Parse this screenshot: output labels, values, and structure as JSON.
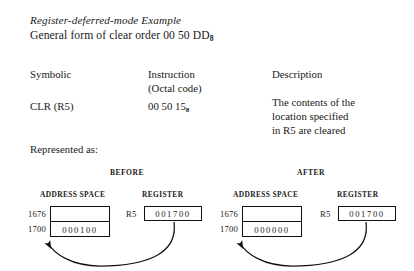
{
  "heading": {
    "title": "Register-deferred-mode Example",
    "subtitle_prefix": "General form of clear order 00  50  DD",
    "subtitle_subscript": "8"
  },
  "table": {
    "symbolic_header": "Symbolic",
    "symbolic_value": "CLR (R5)",
    "instruction_header_line1": "Instruction",
    "instruction_header_line2": "(Octal code)",
    "instruction_value_prefix": "00  50  15",
    "instruction_value_subscript": "8",
    "description_header": "Description",
    "description_line1": "The contents of the",
    "description_line2": "location specified",
    "description_line3": "in R5 are cleared"
  },
  "represented_label": "Represented as:",
  "diagrams": [
    {
      "state_label": "BEFORE",
      "address_space_label": "ADDRESS SPACE",
      "register_label": "REGISTER",
      "memory_rows": [
        {
          "address": "1676",
          "value": ""
        },
        {
          "address": "1700",
          "value": "000100"
        }
      ],
      "register_name": "R5",
      "register_value": "001700"
    },
    {
      "state_label": "AFTER",
      "address_space_label": "ADDRESS SPACE",
      "register_label": "REGISTER",
      "memory_rows": [
        {
          "address": "1676",
          "value": ""
        },
        {
          "address": "1700",
          "value": "000000"
        }
      ],
      "register_name": "R5",
      "register_value": "001700"
    }
  ],
  "colors": {
    "background": "#ffffff",
    "ink": "#1a1a1a",
    "rule": "#111111"
  }
}
